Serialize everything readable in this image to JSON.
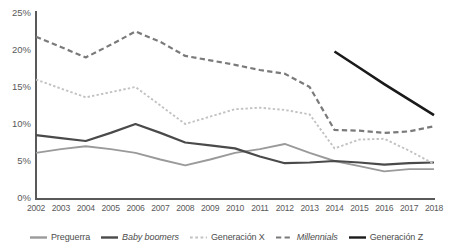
{
  "chart_data": {
    "type": "line",
    "title": "",
    "subtitle": "",
    "xlabel": "",
    "ylabel": "",
    "x": [
      2002,
      2003,
      2004,
      2005,
      2006,
      2007,
      2008,
      2009,
      2010,
      2011,
      2012,
      2013,
      2014,
      2015,
      2016,
      2017,
      2018
    ],
    "categories": [
      "2002",
      "2003",
      "2004",
      "2005",
      "2006",
      "2007",
      "2008",
      "2009",
      "2010",
      "2011",
      "2012",
      "2013",
      "2014",
      "2015",
      "2016",
      "2017",
      "2018"
    ],
    "ylim": [
      0,
      25
    ],
    "yticks": [
      0,
      5,
      10,
      15,
      20,
      25
    ],
    "ytick_labels": [
      "0%",
      "5%",
      "10%",
      "15%",
      "20%",
      "25%"
    ],
    "grid": false,
    "legend_position": "bottom",
    "value_suffix": "%",
    "series": [
      {
        "name": "Preguerra",
        "color": "#9a9a9a",
        "style": "solid",
        "width": 1.9,
        "italic": false,
        "values": [
          6.1,
          6.6,
          7.0,
          6.6,
          6.1,
          5.2,
          4.4,
          5.2,
          6.1,
          6.6,
          7.3,
          6.1,
          5.0,
          4.3,
          3.6,
          3.9,
          3.9
        ]
      },
      {
        "name": "Baby boomers",
        "color": "#4a4a4a",
        "style": "solid",
        "width": 2.2,
        "italic": true,
        "values": [
          8.5,
          8.1,
          7.7,
          8.8,
          10.0,
          8.8,
          7.5,
          7.1,
          6.7,
          5.6,
          4.7,
          4.8,
          5.0,
          4.8,
          4.5,
          4.7,
          4.8
        ]
      },
      {
        "name": "Generación X",
        "color": "#c2c2c2",
        "style": "dotted",
        "width": 1.9,
        "italic": false,
        "values": [
          16.0,
          14.8,
          13.6,
          14.3,
          15.0,
          12.5,
          10.0,
          11.0,
          12.0,
          12.2,
          11.9,
          11.3,
          6.7,
          7.9,
          8.0,
          6.4,
          4.6
        ]
      },
      {
        "name": "Millennials",
        "color": "#7a7a7a",
        "style": "dashed",
        "width": 2.2,
        "italic": true,
        "values": [
          21.8,
          20.4,
          19.0,
          20.7,
          22.5,
          21.1,
          19.2,
          18.6,
          18.0,
          17.3,
          16.8,
          15.0,
          9.2,
          9.1,
          8.8,
          9.0,
          9.7
        ]
      },
      {
        "name": "Generación Z",
        "color": "#1a1a1a",
        "style": "solid",
        "width": 2.6,
        "italic": false,
        "values": [
          null,
          null,
          null,
          null,
          null,
          null,
          null,
          null,
          null,
          null,
          null,
          null,
          19.8,
          17.6,
          15.4,
          13.3,
          11.2
        ]
      }
    ]
  },
  "legend": {
    "items": [
      {
        "label": "Preguerra",
        "color": "#9a9a9a",
        "style": "solid",
        "italic": false
      },
      {
        "label": "Baby boomers",
        "color": "#4a4a4a",
        "style": "solid",
        "italic": true
      },
      {
        "label": "Generación X",
        "color": "#c2c2c2",
        "style": "dotted",
        "italic": false
      },
      {
        "label": "Millennials",
        "color": "#7a7a7a",
        "style": "dashed",
        "italic": true
      },
      {
        "label": "Generación Z",
        "color": "#1a1a1a",
        "style": "solid",
        "italic": false
      }
    ]
  },
  "axes": {
    "y_tick_labels": [
      "25%",
      "20%",
      "15%",
      "10%",
      "5%",
      "0%"
    ],
    "x_tick_labels": [
      "2002",
      "2003",
      "2004",
      "2005",
      "2006",
      "2007",
      "2008",
      "2009",
      "2010",
      "2011",
      "2012",
      "2013",
      "2014",
      "2015",
      "2016",
      "2017",
      "2018"
    ],
    "axis_color": "#595959"
  }
}
